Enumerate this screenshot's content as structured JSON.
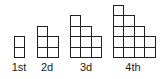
{
  "figures": [
    {
      "label": "1st",
      "columns": [
        2
      ]
    },
    {
      "label": "2d",
      "columns": [
        3,
        2
      ]
    },
    {
      "label": "3d",
      "columns": [
        4,
        3,
        2
      ]
    },
    {
      "label": "4th",
      "columns": [
        5,
        4,
        3,
        2
      ]
    }
  ],
  "colors": {
    "outline": "#222222",
    "background": "#ffffff"
  }
}
